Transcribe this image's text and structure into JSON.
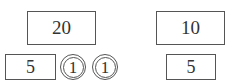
{
  "left_group": {
    "top_note": "20",
    "bottom_note": "5",
    "coins": [
      "1",
      "1"
    ]
  },
  "right_group": {
    "top_note": "10",
    "bottom_note": "5"
  }
}
